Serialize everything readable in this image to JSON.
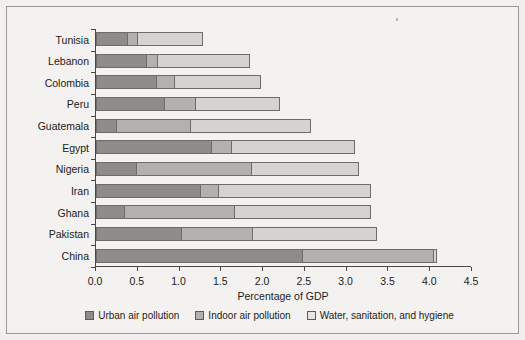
{
  "chart_data": {
    "type": "bar",
    "orientation": "horizontal",
    "stacked": true,
    "title": "",
    "xlabel": "Percentage of GDP",
    "ylabel": "",
    "xlim": [
      0.0,
      4.5
    ],
    "xticks": [
      "0.0",
      "0.5",
      "1.0",
      "1.5",
      "2.0",
      "2.5",
      "3.0",
      "3.5",
      "4.0",
      "4.5"
    ],
    "xtick_values": [
      0.0,
      0.5,
      1.0,
      1.5,
      2.0,
      2.5,
      3.0,
      3.5,
      4.0,
      4.5
    ],
    "grid": false,
    "legend_position": "bottom",
    "categories": [
      "Tunisia",
      "Lebanon",
      "Colombia",
      "Peru",
      "Guatemala",
      "Egypt",
      "Nigeria",
      "Iran",
      "Ghana",
      "Pakistan",
      "China"
    ],
    "series": [
      {
        "name": "Urban air pollution",
        "color": "#8e8c88",
        "values": [
          0.37,
          0.6,
          0.72,
          0.81,
          0.23,
          1.38,
          0.47,
          1.24,
          0.32,
          1.01,
          2.47
        ]
      },
      {
        "name": "Indoor air pollution",
        "color": "#b3b1ad",
        "values": [
          0.12,
          0.13,
          0.21,
          0.38,
          0.89,
          0.24,
          1.39,
          0.22,
          1.33,
          0.86,
          1.57
        ]
      },
      {
        "name": "Water, sanitation, and hygiene",
        "color": "#d5d3cf",
        "values": [
          0.79,
          1.11,
          1.04,
          1.01,
          1.45,
          1.48,
          1.29,
          1.83,
          1.64,
          1.49,
          0.04
        ]
      }
    ],
    "totals": [
      1.28,
      1.84,
      1.97,
      2.2,
      2.57,
      3.1,
      3.15,
      3.29,
      3.29,
      3.36,
      4.08
    ]
  }
}
